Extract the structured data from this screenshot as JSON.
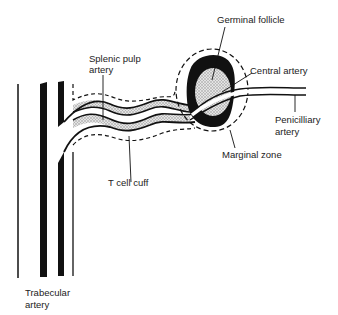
{
  "labels": {
    "germinal_follicle": "Germinal follicle",
    "splenic_pulp_artery_line1": "Splenic pulp",
    "splenic_pulp_artery_line2": "artery",
    "central_artery": "Central artery",
    "penicilliary_artery_line1": "Penicilliary",
    "penicilliary_artery_line2": "artery",
    "marginal_zone": "Marginal zone",
    "t_cell_cuff": "T cell cuff",
    "trabecular_artery_line1": "Trabecular",
    "trabecular_artery_line2": "artery"
  },
  "colors": {
    "ink": "#111111",
    "stipple": "#c8c8c8",
    "background": "#ffffff"
  }
}
